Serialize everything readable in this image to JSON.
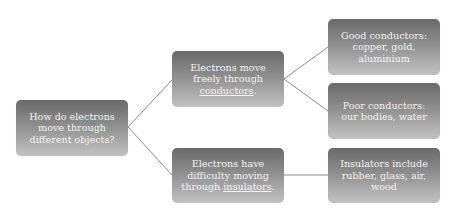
{
  "diagram": {
    "type": "horizontal-tree",
    "colors": {
      "node_gradient_top": "#6a6a6a",
      "node_gradient_bottom": "#c2c2c2",
      "node_text": "#f2f2f2",
      "connector": "#8a8a8a",
      "background": "#ffffff"
    },
    "root": {
      "id": "root",
      "text": "How do electrons move through different objects?"
    },
    "branches": [
      {
        "id": "mid1",
        "text_before": "Electrons move freely through ",
        "keyword": "conductors",
        "text_after": ".",
        "children": [
          {
            "id": "r1",
            "text": "Good conductors: copper, gold, aluminium"
          },
          {
            "id": "r2",
            "text": "Poor conductors: our bodies, water"
          }
        ]
      },
      {
        "id": "mid2",
        "text_before": "Electrons have difficulty moving through ",
        "keyword": "insulators",
        "text_after": ".",
        "children": [
          {
            "id": "r3",
            "text": "Insulators include rubber, glass, air, wood"
          }
        ]
      }
    ]
  }
}
